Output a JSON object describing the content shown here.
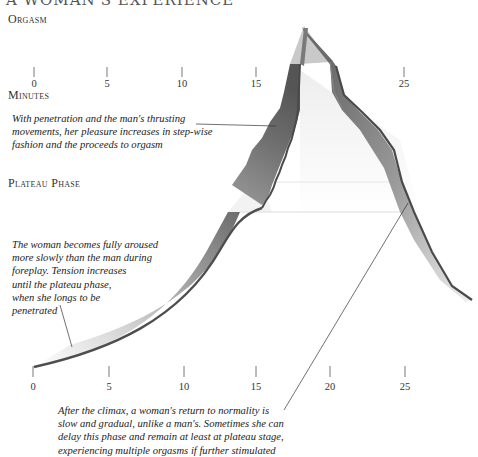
{
  "header": {
    "title_partial": "A WOMAN'S EXPERIENCE"
  },
  "labels": {
    "orgasm": "Orgasm",
    "minutes": "Minutes",
    "plateau_phase": "Plateau Phase"
  },
  "top_axis": {
    "ticks": [
      {
        "label": "0",
        "x": 34
      },
      {
        "label": "5",
        "x": 107
      },
      {
        "label": "10",
        "x": 182
      },
      {
        "label": "15",
        "x": 256
      },
      {
        "label": "25",
        "x": 404
      }
    ]
  },
  "bottom_axis": {
    "ticks": [
      {
        "label": "0",
        "x": 33
      },
      {
        "label": "5",
        "x": 109
      },
      {
        "label": "10",
        "x": 184
      },
      {
        "label": "15",
        "x": 256
      },
      {
        "label": "20",
        "x": 330
      },
      {
        "label": "25",
        "x": 405
      }
    ]
  },
  "annotations": {
    "penetration": "With penetration and the man's thrusting\nmovements, her pleasure increases in step-wise\nfashion and the proceeds to orgasm",
    "arousal": "The woman becomes fully aroused\nmore slowly than the man during\nforeplay. Tension increases\nuntil the plateau phase,\nwhen she longs to be\npenetrated",
    "after_climax": "After the climax, a woman's return to normality is\nslow and gradual, unlike a man's. Sometimes she can\ndelay this phase and remain at least at plateau stage,\nexperiencing multiple orgasms if further stimulated"
  },
  "colors": {
    "ribbon_dark": "#5a5a5a",
    "ribbon_mid": "#9a9a9a",
    "ribbon_light": "#e6e6e6",
    "edge": "#4a4a4a",
    "text": "#222222"
  }
}
